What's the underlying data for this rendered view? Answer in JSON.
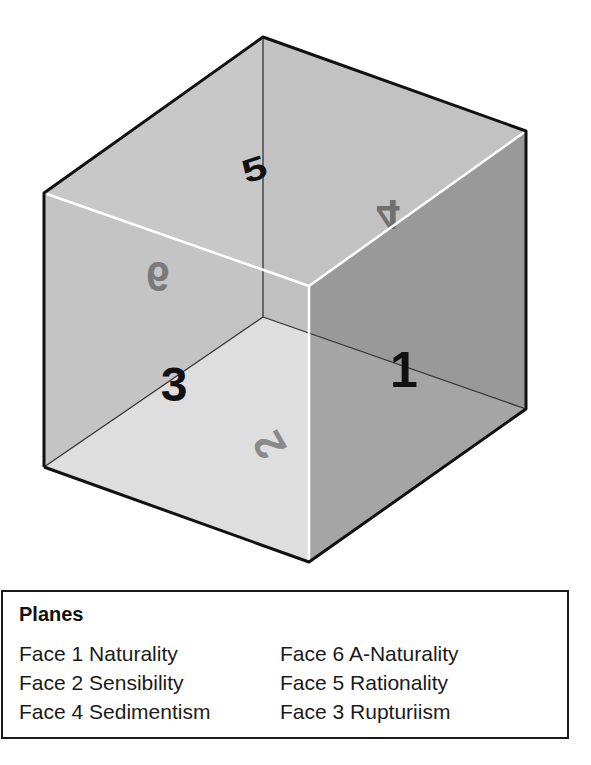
{
  "diagram": {
    "type": "transparent-cube",
    "face_labels": {
      "face_1": "1",
      "face_2": "2",
      "face_3": "3",
      "face_4": "4",
      "face_5": "5",
      "face_6": "6"
    },
    "colors": {
      "top_face": "#cdcdcd",
      "back_left_face": "#c4c4c4",
      "back_right_face": "#bdbdbd",
      "bottom_face": "#ececec",
      "front_right_face": "#9e9e9e",
      "front_left_face": "#c6c6c6",
      "edge_dark": "#111111",
      "edge_light": "#ffffff",
      "label_dark": "#111111",
      "label_faded": "#7a7a7a"
    }
  },
  "legend": {
    "title": "Planes",
    "left_items": [
      {
        "label": "Face 1 Naturality"
      },
      {
        "label": "Face 2 Sensibility"
      },
      {
        "label": "Face 4 Sedimentism"
      }
    ],
    "right_items": [
      {
        "label": "Face 6 A-Naturality"
      },
      {
        "label": "Face 5 Rationality"
      },
      {
        "label": "Face 3 Rupturiism"
      }
    ]
  }
}
